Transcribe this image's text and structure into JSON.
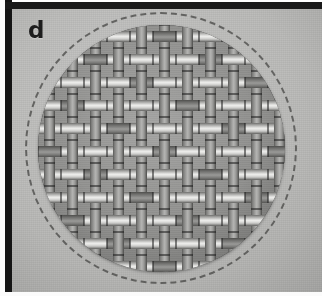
{
  "figure": {
    "panel_letter": "d",
    "colors": {
      "plate_background": "#bcbcba",
      "frame_stroke": "#151515",
      "solid_circle": "#111111",
      "dashed_circle": "#5c5c5a",
      "weave_light_strand": "#eeeeec",
      "weave_dark_strand": "#54544f",
      "panel_letter": "#1d1d1d"
    },
    "solid_circle": {
      "center_x": 161,
      "center_y": 148,
      "diameter": 247
    },
    "dashed_circle": {
      "center_x": 161,
      "center_y": 148,
      "diameter": 272,
      "dash_style": "dashed",
      "stroke_width": 2.5
    },
    "weave": {
      "pattern": "plain-twill basket weave",
      "repeat_px": 23,
      "strand_width_px": 11,
      "rows": 14,
      "columns": 14,
      "orientations": [
        "horizontal",
        "vertical"
      ]
    }
  }
}
